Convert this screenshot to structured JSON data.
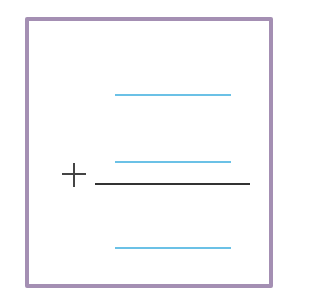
{
  "worksheet": {
    "type": "vertical-addition-template",
    "operator": "+",
    "colors": {
      "frame": "#a48fb3",
      "answer_lines": "#6bc1e6",
      "sum_bar": "#333333"
    },
    "blanks": [
      {
        "role": "addend-1"
      },
      {
        "role": "addend-2"
      },
      {
        "role": "sum"
      }
    ]
  }
}
